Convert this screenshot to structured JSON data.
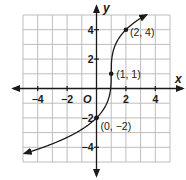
{
  "chart_data": {
    "type": "line",
    "title": "",
    "xlabel": "x",
    "ylabel": "y",
    "origin_label": "O",
    "xlim": [
      -5,
      5
    ],
    "ylim": [
      -5,
      5
    ],
    "grid": true,
    "x_ticks": [
      -4,
      -2,
      2,
      4
    ],
    "y_ticks": [
      4,
      2,
      -2,
      -4
    ],
    "x_tick_labels": [
      "−4",
      "−2",
      "2",
      "4"
    ],
    "y_tick_labels": [
      "4",
      "2",
      "−2",
      "−4"
    ],
    "series": [
      {
        "name": "y = 3∛(x − 1) + 1",
        "function": "3*cbrt(x-1)+1",
        "x_range": [
          -4.9,
          3.4
        ],
        "arrows": "both"
      }
    ],
    "points": [
      {
        "x": 2,
        "y": 4,
        "label": "(2, 4)"
      },
      {
        "x": 1,
        "y": 1,
        "label": "(1, 1)"
      },
      {
        "x": 0,
        "y": -2,
        "label": "(0, −2)"
      }
    ]
  }
}
